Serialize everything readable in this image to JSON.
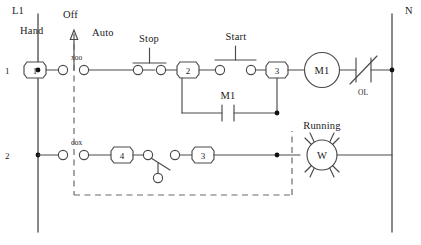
{
  "diagram": {
    "type": "ladder-logic",
    "line_color": "#4a4a4a",
    "dashed_color": "#6a6a6a",
    "text_color": "#1b1b1b",
    "background": "#ffffff"
  },
  "rails": {
    "left": {
      "label": "L1",
      "x": 38
    },
    "right": {
      "label": "N",
      "x": 392
    }
  },
  "rungs": [
    {
      "number": "1",
      "y": 70,
      "name": "motor-starter-rung"
    },
    {
      "number": "2",
      "y": 155,
      "name": "running-lamp-rung"
    }
  ],
  "selector_switch": {
    "name": "hand-off-auto-selector",
    "positions": [
      "Hand",
      "Off",
      "Auto"
    ],
    "hand_label": "Hand",
    "off_label": "Off",
    "auto_label": "Auto",
    "contact_1_code": "xoo",
    "contact_2_code": "oox",
    "arrow_label": "Off"
  },
  "components": {
    "stop_pushbutton": {
      "label": "Stop",
      "type": "normally-closed-pushbutton",
      "x": 155
    },
    "start_pushbutton": {
      "label": "Start",
      "type": "normally-open-pushbutton",
      "x": 237
    },
    "seal_in_contact": {
      "label": "M1",
      "type": "normally-open-contact",
      "x": 228
    },
    "motor_coil": {
      "label": "M1",
      "type": "coil",
      "x": 322,
      "y": 70
    },
    "overload": {
      "label": "OL",
      "type": "overload-relay-contact",
      "x": 364,
      "y": 70
    },
    "running_lamp": {
      "label": "Running",
      "glyph": "W",
      "type": "indicator-lamp",
      "x": 322,
      "y": 155
    },
    "auto_contact": {
      "type": "selector-contact",
      "x": 160,
      "y": 155
    }
  },
  "nodes": [
    {
      "id": "1",
      "x": 35,
      "y": 70,
      "shape": "octagon"
    },
    {
      "id": "2",
      "x": 188,
      "y": 70,
      "shape": "octagon"
    },
    {
      "id": "3",
      "x": 277,
      "y": 70,
      "shape": "octagon"
    },
    {
      "id": "4",
      "x": 122,
      "y": 155,
      "shape": "octagon"
    },
    {
      "id": "3",
      "x": 203,
      "y": 155,
      "shape": "octagon"
    }
  ],
  "junctions": [
    {
      "name": "l1-rung1-junction",
      "x": 38,
      "y": 70
    },
    {
      "name": "l1-rung2-junction",
      "x": 38,
      "y": 155
    },
    {
      "name": "n-rung1-junction",
      "x": 392,
      "y": 70
    },
    {
      "name": "seal-in-junction",
      "x": 277,
      "y": 113
    },
    {
      "name": "lamp-feed-junction",
      "x": 277,
      "y": 155
    }
  ],
  "mechanical_link": {
    "name": "selector-mechanical-linkage",
    "style": "dashed",
    "description": "dashed interlock line from selector switch down and across to the Running lamp"
  }
}
